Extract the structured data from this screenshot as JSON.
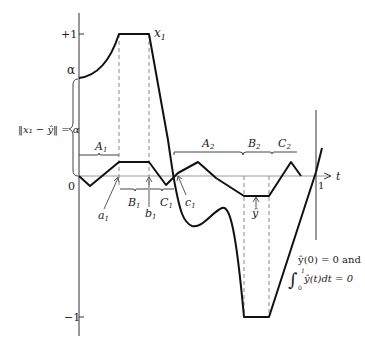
{
  "figure": {
    "y_axis_ticks": {
      "plus_one": "+1",
      "alpha": "α",
      "zero": "0",
      "minus_one": "−1"
    },
    "t_axis": {
      "label": "t",
      "tick_one": "1"
    },
    "curve_labels": {
      "x1": "x",
      "x1_sub": "1",
      "y_hat": "ŷ"
    },
    "norm_label": {
      "text": "‖x₁ − ŷ‖ = α"
    },
    "intervals": {
      "A1": {
        "name": "A",
        "sub": "1"
      },
      "B1": {
        "name": "B",
        "sub": "1"
      },
      "C1": {
        "name": "C",
        "sub": "1"
      },
      "A2": {
        "name": "A",
        "sub": "2"
      },
      "B2": {
        "name": "B",
        "sub": "2"
      },
      "C2": {
        "name": "C",
        "sub": "2"
      }
    },
    "points": {
      "a1": {
        "name": "a",
        "sub": "1"
      },
      "b1": {
        "name": "b",
        "sub": "1"
      },
      "c1": {
        "name": "c",
        "sub": "1"
      }
    },
    "conditions": {
      "line1": "ŷ(0) = 0 and",
      "integral_sign": "∫",
      "lower_limit": "0",
      "upper_limit": "1",
      "line2": "ŷ(t)dt = 0"
    }
  }
}
